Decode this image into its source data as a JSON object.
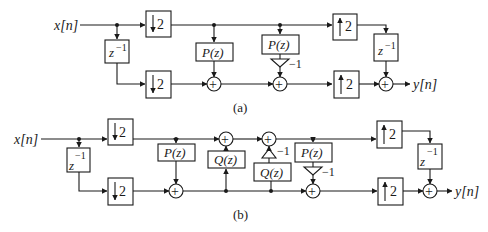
{
  "figure": {
    "part_a": {
      "caption": "(a)",
      "input_label": "x[n]",
      "output_label": "y[n]",
      "blocks": {
        "down_top": "2",
        "down_bottom": "2",
        "delay_in": "z",
        "delay_in_exp": "−1",
        "predict": "P(z)",
        "update_p": "P(z)",
        "gain": "−1",
        "up_top": "2",
        "up_bottom": "2",
        "delay_out": "z",
        "delay_out_exp": "−1"
      }
    },
    "part_b": {
      "caption": "(b)",
      "input_label": "x[n]",
      "output_label": "y[n]",
      "blocks": {
        "down_top": "2",
        "down_bottom": "2",
        "delay_in": "z",
        "delay_in_exp": "−1",
        "predict": "P(z)",
        "update": "Q(z)",
        "q_inv": "Q(z)",
        "q_gain": "−1",
        "p_inv": "P(z)",
        "p_gain": "−1",
        "up_top": "2",
        "up_bottom": "2",
        "delay_out": "z",
        "delay_out_exp": "−1"
      }
    },
    "symbols": {
      "adder": "+"
    },
    "colors": {
      "stroke": "#1a1a1a",
      "background": "#ffffff"
    }
  }
}
